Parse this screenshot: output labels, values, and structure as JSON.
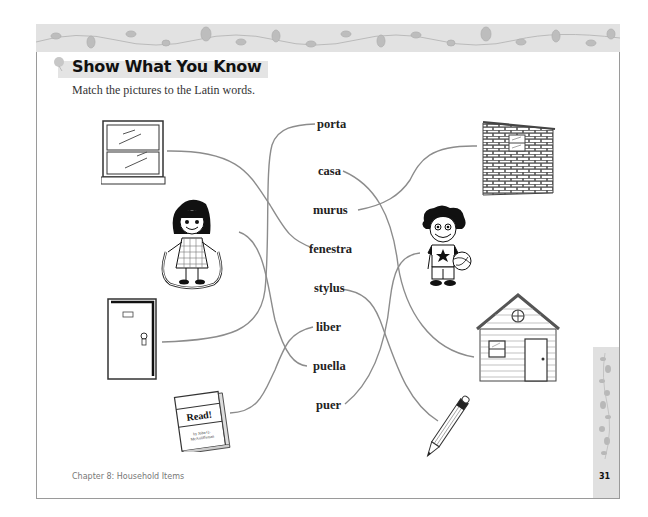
{
  "header": {
    "title": "Show What You Know",
    "instructions": "Match the pictures to the Latin words."
  },
  "words": [
    {
      "id": "porta",
      "label": "porta"
    },
    {
      "id": "casa",
      "label": "casa"
    },
    {
      "id": "murus",
      "label": "murus"
    },
    {
      "id": "fenestra",
      "label": "fenestra"
    },
    {
      "id": "stylus",
      "label": "stylus"
    },
    {
      "id": "liber",
      "label": "liber"
    },
    {
      "id": "puella",
      "label": "puella"
    },
    {
      "id": "puer",
      "label": "puer"
    }
  ],
  "pictures": {
    "left": [
      "window",
      "girl",
      "door",
      "book"
    ],
    "right": [
      "brick-wall",
      "boy",
      "house",
      "pencil"
    ]
  },
  "book": {
    "title": "Read!",
    "author_line1": "by John Q.",
    "author_line2": "McAuliffeman"
  },
  "matches": [
    {
      "picture": "window",
      "word": "fenestra"
    },
    {
      "picture": "girl",
      "word": "puella"
    },
    {
      "picture": "door",
      "word": "porta"
    },
    {
      "picture": "book",
      "word": "liber"
    },
    {
      "picture": "brick-wall",
      "word": "murus"
    },
    {
      "picture": "boy",
      "word": "puer"
    },
    {
      "picture": "house",
      "word": "casa"
    },
    {
      "picture": "pencil",
      "word": "stylus"
    }
  ],
  "footer": {
    "chapter": "Chapter 8: Household Items",
    "page_number": "31"
  },
  "colors": {
    "line": "#8c8c8c",
    "banner": "#e2e2e2",
    "text": "#222222"
  }
}
